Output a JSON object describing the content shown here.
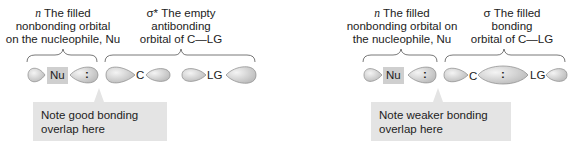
{
  "left_panel": {
    "n_label": {
      "symbol": "n",
      "lines": [
        "The filled",
        "nonbonding orbital",
        "on the nucleophile, Nu"
      ]
    },
    "sigma_label": {
      "symbol": "σ*",
      "lines": [
        "The empty",
        "antibonding",
        "orbital of C—LG"
      ]
    },
    "atoms": {
      "nu": "Nu",
      "c": "C",
      "lg": "LG"
    },
    "lone_pair": ":",
    "note": [
      "Note good bonding",
      "overlap here"
    ]
  },
  "right_panel": {
    "n_label": {
      "symbol": "n",
      "lines": [
        "The filled",
        "nonbonding orbital on",
        "the nucleophile, Nu"
      ]
    },
    "sigma_label": {
      "symbol": "σ",
      "lines": [
        "The filled",
        "bonding",
        "orbital of C—LG"
      ]
    },
    "atoms": {
      "nu": "Nu",
      "c": "C",
      "lg": "LG"
    },
    "lone_pair_nu": ":",
    "lone_pair_bond": ":",
    "note": [
      "Note weaker bonding",
      "overlap here"
    ]
  },
  "colors": {
    "orbital_fill": "#d6d6d6",
    "orbital_stroke": "#8a8a8a",
    "note_bg": "#e4e4e4",
    "atom_box": "#cfcfcf"
  }
}
